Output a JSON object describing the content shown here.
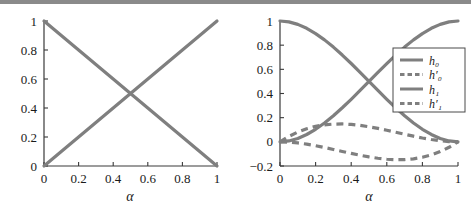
{
  "figure": {
    "background_color": "#ffffff",
    "curve_color": "#7f7f7f",
    "axis_color": "#3a3a3a",
    "top_rule_color": "#8a8a8a"
  },
  "chart_data": [
    {
      "type": "line",
      "panel": "left",
      "title": "",
      "xlabel": "α",
      "ylabel": "",
      "xlim": [
        0,
        1
      ],
      "ylim": [
        0,
        1
      ],
      "xticks": [
        0,
        0.2,
        0.4,
        0.6,
        0.8,
        1
      ],
      "xticklabels": [
        "0",
        "0.2",
        "0.4",
        "0.6",
        "0.8",
        "1"
      ],
      "yticks": [
        0,
        0.2,
        0.4,
        0.6,
        0.8,
        1
      ],
      "yticklabels": [
        "0",
        "0.2",
        "0.4",
        "0.6",
        "0.8",
        "1"
      ],
      "grid": false,
      "legend": false,
      "x": [
        0,
        0.1,
        0.2,
        0.3,
        0.4,
        0.5,
        0.6,
        0.7,
        0.8,
        0.9,
        1
      ],
      "series": [
        {
          "name": "h0",
          "style": "solid",
          "color": "#7f7f7f",
          "values": [
            1,
            0.9,
            0.8,
            0.7,
            0.6,
            0.5,
            0.4,
            0.3,
            0.2,
            0.1,
            0
          ]
        },
        {
          "name": "h1",
          "style": "solid",
          "color": "#7f7f7f",
          "values": [
            0,
            0.1,
            0.2,
            0.3,
            0.4,
            0.5,
            0.6,
            0.7,
            0.8,
            0.9,
            1
          ]
        }
      ]
    },
    {
      "type": "line",
      "panel": "right",
      "title": "",
      "xlabel": "α",
      "ylabel": "",
      "xlim": [
        0,
        1
      ],
      "ylim": [
        -0.2,
        1
      ],
      "xticks": [
        0,
        0.2,
        0.4,
        0.6,
        0.8,
        1
      ],
      "xticklabels": [
        "0",
        "0.2",
        "0.4",
        "0.6",
        "0.8",
        "1"
      ],
      "yticks": [
        -0.2,
        0,
        0.2,
        0.4,
        0.6,
        0.8,
        1
      ],
      "yticklabels": [
        "−0.2",
        "0",
        "0.2",
        "0.4",
        "0.6",
        "0.8",
        "1"
      ],
      "grid": false,
      "legend": true,
      "legend_position": "upper right",
      "legend_entries": [
        {
          "label": "h₀",
          "style": "solid",
          "color": "#7f7f7f"
        },
        {
          "label": "h′₀",
          "style": "dashed",
          "color": "#7f7f7f"
        },
        {
          "label": "h₁",
          "style": "solid",
          "color": "#7f7f7f"
        },
        {
          "label": "h′₁",
          "style": "dashed",
          "color": "#7f7f7f"
        }
      ],
      "x": [
        0,
        0.05,
        0.1,
        0.15,
        0.2,
        0.25,
        0.3,
        0.35,
        0.4,
        0.45,
        0.5,
        0.55,
        0.6,
        0.65,
        0.7,
        0.75,
        0.8,
        0.85,
        0.9,
        0.95,
        1
      ],
      "series": [
        {
          "name": "h0",
          "style": "solid",
          "color": "#7f7f7f",
          "values": [
            1,
            0.9928,
            0.972,
            0.9393,
            0.896,
            0.8438,
            0.784,
            0.7183,
            0.648,
            0.5748,
            0.5,
            0.4253,
            0.352,
            0.2818,
            0.216,
            0.1563,
            0.104,
            0.0608,
            0.028,
            0.0073,
            0
          ]
        },
        {
          "name": "h0prime",
          "style": "dashed",
          "color": "#7f7f7f",
          "values": [
            0,
            0.0451,
            0.081,
            0.1084,
            0.128,
            0.1406,
            0.147,
            0.1479,
            0.144,
            0.1361,
            0.125,
            0.1114,
            0.096,
            0.0796,
            0.063,
            0.0469,
            0.032,
            0.0191,
            0.009,
            0.0024,
            0
          ]
        },
        {
          "name": "h1",
          "style": "solid",
          "color": "#7f7f7f",
          "values": [
            0,
            0.0073,
            0.028,
            0.0607,
            0.104,
            0.1563,
            0.216,
            0.2818,
            0.352,
            0.4253,
            0.5,
            0.5748,
            0.648,
            0.7183,
            0.784,
            0.8438,
            0.896,
            0.9393,
            0.972,
            0.9927,
            1
          ]
        },
        {
          "name": "h1prime",
          "style": "dashed",
          "color": "#7f7f7f",
          "values": [
            0,
            -0.0024,
            -0.009,
            -0.0191,
            -0.032,
            -0.0469,
            -0.063,
            -0.0796,
            -0.096,
            -0.1114,
            -0.125,
            -0.1361,
            -0.144,
            -0.1479,
            -0.147,
            -0.1406,
            -0.128,
            -0.1084,
            -0.081,
            -0.0451,
            0
          ]
        }
      ]
    }
  ]
}
